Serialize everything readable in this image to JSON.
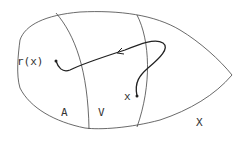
{
  "diagram": {
    "labels": {
      "retraction": "r(x)",
      "point": "x",
      "region_a": "A",
      "region_v": "V",
      "space": "X"
    },
    "colors": {
      "stroke": "#444444",
      "path": "#222222",
      "background": "#ffffff"
    }
  }
}
